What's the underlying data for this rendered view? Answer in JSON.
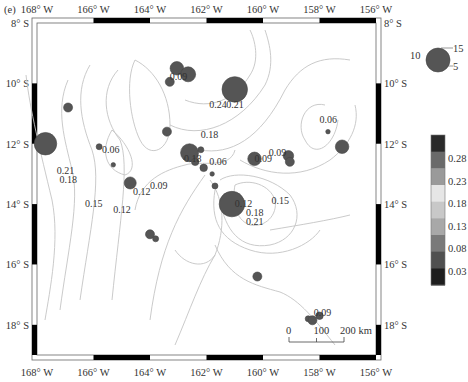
{
  "panel_label": "(e)",
  "map": {
    "lon_range": [
      -168,
      -156
    ],
    "lat_range": [
      -19,
      -8
    ],
    "lon_ticks": [
      {
        "value": -168,
        "label": "168° W"
      },
      {
        "value": -166,
        "label": "166° W"
      },
      {
        "value": -164,
        "label": "164° W"
      },
      {
        "value": -162,
        "label": "162° W"
      },
      {
        "value": -160,
        "label": "160° W"
      },
      {
        "value": -158,
        "label": "158° W"
      },
      {
        "value": -156,
        "label": "156° W"
      }
    ],
    "lat_ticks": [
      {
        "value": -8,
        "label": "8° S"
      },
      {
        "value": -10,
        "label": "10° S"
      },
      {
        "value": -12,
        "label": "12° S"
      },
      {
        "value": -14,
        "label": "14° S"
      },
      {
        "value": -16,
        "label": "16° S"
      },
      {
        "value": -18,
        "label": "18° S"
      }
    ],
    "contour_labels": [
      {
        "text": "0.09",
        "lon": -163.3,
        "lat": -9.9
      },
      {
        "text": "0.24",
        "lon": -161.9,
        "lat": -10.8
      },
      {
        "text": "0.21",
        "lon": -161.3,
        "lat": -10.8
      },
      {
        "text": "0.18",
        "lon": -162.2,
        "lat": -11.8
      },
      {
        "text": "0.06",
        "lon": -158.0,
        "lat": -11.3
      },
      {
        "text": "0.06",
        "lon": -165.7,
        "lat": -12.3
      },
      {
        "text": "0.18",
        "lon": -162.8,
        "lat": -12.6
      },
      {
        "text": "0.06",
        "lon": -161.9,
        "lat": -12.7
      },
      {
        "text": "0.09",
        "lon": -160.3,
        "lat": -12.6
      },
      {
        "text": "0.09",
        "lon": -159.8,
        "lat": -12.4
      },
      {
        "text": "0.21",
        "lon": -167.3,
        "lat": -13.0
      },
      {
        "text": "0.18",
        "lon": -167.2,
        "lat": -13.3
      },
      {
        "text": "0.15",
        "lon": -166.3,
        "lat": -14.1
      },
      {
        "text": "0.12",
        "lon": -165.3,
        "lat": -14.3
      },
      {
        "text": "0.12",
        "lon": -164.6,
        "lat": -13.7
      },
      {
        "text": "0.09",
        "lon": -164.0,
        "lat": -13.5
      },
      {
        "text": "0.12",
        "lon": -161.0,
        "lat": -14.1
      },
      {
        "text": "0.15",
        "lon": -159.7,
        "lat": -14.0
      },
      {
        "text": "0.18",
        "lon": -160.6,
        "lat": -14.4
      },
      {
        "text": "0.21",
        "lon": -160.6,
        "lat": -14.7
      },
      {
        "text": "0.09",
        "lon": -158.2,
        "lat": -17.7
      }
    ],
    "earthquakes": [
      {
        "lon": -167.7,
        "lat": -12.0,
        "magnitude": 15
      },
      {
        "lon": -166.9,
        "lat": -10.8,
        "magnitude": 6
      },
      {
        "lon": -163.3,
        "lat": -9.95,
        "magnitude": 6
      },
      {
        "lon": -163.05,
        "lat": -9.5,
        "magnitude": 9
      },
      {
        "lon": -162.65,
        "lat": -9.7,
        "magnitude": 10
      },
      {
        "lon": -161.0,
        "lat": -10.2,
        "magnitude": 17
      },
      {
        "lon": -163.4,
        "lat": -11.6,
        "magnitude": 6
      },
      {
        "lon": -165.8,
        "lat": -12.1,
        "magnitude": 4
      },
      {
        "lon": -165.3,
        "lat": -12.7,
        "magnitude": 3
      },
      {
        "lon": -162.6,
        "lat": -12.3,
        "magnitude": 12
      },
      {
        "lon": -162.2,
        "lat": -12.2,
        "magnitude": 4
      },
      {
        "lon": -162.4,
        "lat": -12.6,
        "magnitude": 5
      },
      {
        "lon": -162.1,
        "lat": -12.8,
        "magnitude": 5
      },
      {
        "lon": -164.7,
        "lat": -13.3,
        "magnitude": 8
      },
      {
        "lon": -160.3,
        "lat": -12.5,
        "magnitude": 9
      },
      {
        "lon": -159.1,
        "lat": -12.4,
        "magnitude": 7
      },
      {
        "lon": -159.05,
        "lat": -12.6,
        "magnitude": 6
      },
      {
        "lon": -157.2,
        "lat": -12.1,
        "magnitude": 9
      },
      {
        "lon": -157.7,
        "lat": -11.6,
        "magnitude": 3
      },
      {
        "lon": -161.8,
        "lat": -13.0,
        "magnitude": 3
      },
      {
        "lon": -161.7,
        "lat": -13.4,
        "magnitude": 4
      },
      {
        "lon": -161.1,
        "lat": -14.0,
        "magnitude": 17
      },
      {
        "lon": -164.0,
        "lat": -15.0,
        "magnitude": 6
      },
      {
        "lon": -163.8,
        "lat": -15.15,
        "magnitude": 4
      },
      {
        "lon": -160.2,
        "lat": -16.4,
        "magnitude": 6
      },
      {
        "lon": -158.4,
        "lat": -17.8,
        "magnitude": 4
      },
      {
        "lon": -158.25,
        "lat": -17.85,
        "magnitude": 6
      },
      {
        "lon": -158.0,
        "lat": -17.7,
        "magnitude": 5
      }
    ],
    "scale_bar": {
      "labels": [
        "0",
        "100",
        "200 km"
      ]
    }
  },
  "size_legend": {
    "labels": [
      "10",
      "15",
      "5"
    ]
  },
  "colorbar": {
    "colors": [
      "#2a2a2a",
      "#6a6a6a",
      "#9a9a9a",
      "#e6e6e6",
      "#c8c8c8",
      "#a8a8a8",
      "#7a7a7a",
      "#505050",
      "#1e1e1e"
    ],
    "tick_labels": [
      "0.28",
      "0.23",
      "0.18",
      "0.13",
      "0.08",
      "0.03"
    ]
  }
}
